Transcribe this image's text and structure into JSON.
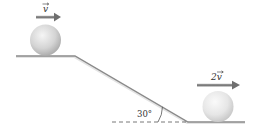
{
  "diagram": {
    "upper_ball_velocity_label": "v",
    "lower_ball_velocity_label": "2v",
    "angle_label": "30°",
    "colors": {
      "arrow": "#7a7a7a",
      "surface": "#8a8a8a",
      "ball_light": "#f2f2f2",
      "ball_dark": "#b5b5b5",
      "dashed_line": "#555555"
    }
  }
}
